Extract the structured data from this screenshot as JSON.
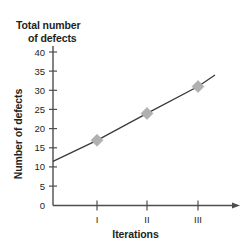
{
  "chart_data": {
    "type": "line",
    "title": "Total number of defects",
    "title_line1": "Total number",
    "title_line2": "of defects",
    "xlabel": "Iterations",
    "ylabel": "Number of defects",
    "categories": [
      "I",
      "II",
      "III"
    ],
    "values": [
      17,
      24,
      31
    ],
    "series": [
      {
        "name": "Total number of defects",
        "values": [
          17,
          24,
          31
        ]
      }
    ],
    "ylim": [
      0,
      40
    ],
    "yticks": [
      0,
      5,
      10,
      15,
      20,
      25,
      30,
      35,
      40
    ],
    "ytick_labels": [
      "0",
      "5",
      "10",
      "15",
      "20",
      "25",
      "30",
      "35",
      "40"
    ],
    "xtick_labels": [
      "I",
      "II",
      "III"
    ],
    "grid": false,
    "legend": false,
    "trend_start_value": 11.5,
    "trend_end_value": 34,
    "marker_shape": "diamond",
    "colors": {
      "line": "#3a3a3a",
      "marker": "#b0b0b0",
      "axis": "#4d4d4d",
      "text": "#231f20",
      "background": "#ffffff"
    }
  }
}
